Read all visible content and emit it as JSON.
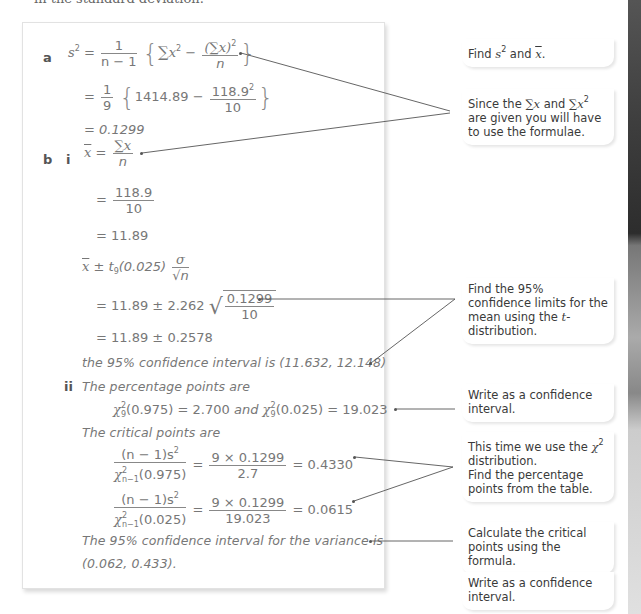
{
  "header": {
    "clipped_text": "in the standard deviation."
  },
  "solution": {
    "part_a": {
      "label": "a",
      "line1": {
        "lhs": "s",
        "lhs_sup": "2",
        "eq": "=",
        "frac_num": "1",
        "frac_den": "n − 1",
        "open_brace": "{",
        "sigma": "∑",
        "x": "x",
        "x_sup": "2",
        "minus": "−",
        "inner_num": "(∑x)",
        "inner_num_sup": "2",
        "inner_den": "n",
        "close_brace": "}"
      },
      "line2": {
        "eq": "=",
        "frac_num": "1",
        "frac_den": "9",
        "open_brace": "{",
        "value": "1414.89",
        "minus": "−",
        "inner_num": "118.9",
        "inner_num_sup": "2",
        "inner_den": "10",
        "close_brace": "}"
      },
      "line3": "= 0.1299"
    },
    "part_b": {
      "label": "b",
      "sub_i": {
        "label": "i",
        "line1": {
          "lhs": "x",
          "eq": "=",
          "num": "∑x",
          "den": "n"
        },
        "line2": {
          "eq": "=",
          "num": "118.9",
          "den": "10"
        },
        "line3": "= 11.89",
        "line4": {
          "lhs": "x",
          "pm": "±",
          "t": "t",
          "t_sub": "9",
          "arg": "(0.025)",
          "num": "σ",
          "den": "√n"
        },
        "line5": {
          "prefix": "= 11.89 ± 2.262",
          "sqrt_num": "0.1299",
          "sqrt_den": "10"
        },
        "line6": "= 11.89 ± 0.2578",
        "line7": "the 95% confidence interval is (11.632, 12.148)"
      },
      "sub_ii": {
        "label": "ii",
        "line1": "The percentage points are",
        "line2": {
          "chi1": "χ",
          "chi1_sup": "2",
          "chi1_sub": "9",
          "arg1": "(0.975) = 2.700",
          "and": "and",
          "chi2": "χ",
          "chi2_sup": "2",
          "chi2_sub": "9",
          "arg2": "(0.025) = 19.023"
        },
        "line3": "The critical points are",
        "crit1": {
          "num": "(n − 1)s",
          "num_sup": "2",
          "den_chi": "χ",
          "den_sup": "2",
          "den_sub": "n−1",
          "den_arg": "(0.975)",
          "eq": "=",
          "rhs_num": "9 × 0.1299",
          "rhs_den": "2.7",
          "result": "= 0.4330"
        },
        "crit2": {
          "num": "(n − 1)s",
          "num_sup": "2",
          "den_chi": "χ",
          "den_sup": "2",
          "den_sub": "n−1",
          "den_arg": "(0.025)",
          "eq": "=",
          "rhs_num": "9 × 0.1299",
          "rhs_den": "19.023",
          "result": "= 0.0615"
        },
        "line4": "The 95% confidence interval for the variance is",
        "line5": "(0.062, 0.433)."
      }
    }
  },
  "notes": [
    {
      "id": "find-s2-xbar",
      "pre": "Find ",
      "s": "s",
      "sup": "2",
      "mid": " and ",
      "xbar": "x",
      "post": "."
    },
    {
      "id": "since-sums-given",
      "pre": "Since the ",
      "sum1": "∑x",
      "mid": " and ",
      "sum2": "∑x",
      "sup": "2",
      "post": " are given you will have to use the formulae."
    },
    {
      "id": "find-95-limits",
      "pre": "Find the 95% confidence limits for the mean using the ",
      "t": "t",
      "post": "-distribution."
    },
    {
      "id": "write-ci-1",
      "text": "Write as a confidence interval."
    },
    {
      "id": "chi2-distribution",
      "pre": "This time we use the ",
      "chi": "χ",
      "sup": "2",
      "post": " distribution.",
      "line2": "Find the percentage points from the table."
    },
    {
      "id": "calc-critical",
      "text": "Calculate the critical points using the formula."
    },
    {
      "id": "write-ci-2",
      "text": "Write as a confidence interval."
    }
  ],
  "colors": {
    "math_text": "#777777",
    "note_text": "#3a3a3a",
    "connector_line": "#555555",
    "box_border": "#e2e2e2"
  }
}
